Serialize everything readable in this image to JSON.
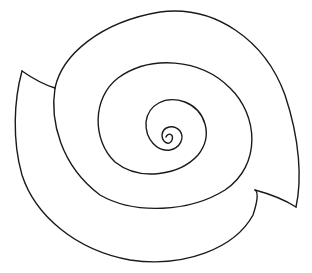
{
  "diagram": {
    "type": "line-drawing",
    "stroke_color": "#1a1a1a",
    "background_color": "#ffffff",
    "elements": [
      {
        "name": "outer-shell",
        "description": "large outer curve of the spiral band"
      },
      {
        "name": "inner-spiral",
        "description": "spiral line winding into the center"
      },
      {
        "name": "left-cap",
        "description": "short edge closing the band on the left"
      },
      {
        "name": "right-cap",
        "description": "short edge closing the band on the lower right"
      }
    ]
  }
}
